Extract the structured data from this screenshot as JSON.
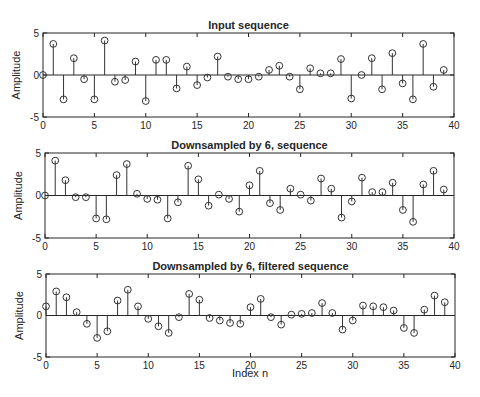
{
  "figure": {
    "width": 480,
    "height": 397,
    "xlabel_bottom": "Index n"
  },
  "chart_data": [
    {
      "type": "stem",
      "title": "Input sequence",
      "xlabel": "",
      "ylabel": "Amplitude",
      "xlim": [
        0,
        40
      ],
      "ylim": [
        -5,
        5
      ],
      "xticks": [
        0,
        5,
        10,
        15,
        20,
        25,
        30,
        35,
        40
      ],
      "yticks": [
        -5,
        0,
        5
      ],
      "grid": false,
      "x": [
        0,
        1,
        2,
        3,
        4,
        5,
        6,
        7,
        8,
        9,
        10,
        11,
        12,
        13,
        14,
        15,
        16,
        17,
        18,
        19,
        20,
        21,
        22,
        23,
        24,
        25,
        26,
        27,
        28,
        29,
        30,
        31,
        32,
        33,
        34,
        35,
        36,
        37,
        38,
        39
      ],
      "values": [
        0,
        3.7,
        -2.9,
        2.0,
        -0.5,
        -2.9,
        4.1,
        -0.8,
        -0.6,
        1.6,
        -3.1,
        1.8,
        1.8,
        -1.6,
        1.0,
        -1.2,
        -0.3,
        2.2,
        -0.2,
        -0.5,
        -0.5,
        -0.2,
        0.6,
        1.1,
        -0.2,
        -1.7,
        0.8,
        0.2,
        0.2,
        1.9,
        -2.8,
        0,
        2.0,
        -1.7,
        2.6,
        -1.0,
        -2.9,
        3.7,
        -1.4,
        0.6
      ]
    },
    {
      "type": "stem",
      "title": "Downsampled by 6,  sequence",
      "xlabel": "",
      "ylabel": "Amplitude",
      "xlim": [
        0,
        40
      ],
      "ylim": [
        -5,
        5
      ],
      "xticks": [
        0,
        5,
        10,
        15,
        20,
        25,
        30,
        35,
        40
      ],
      "yticks": [
        -5,
        0,
        5
      ],
      "grid": false,
      "x": [
        0,
        1,
        2,
        3,
        4,
        5,
        6,
        7,
        8,
        9,
        10,
        11,
        12,
        13,
        14,
        15,
        16,
        17,
        18,
        19,
        20,
        21,
        22,
        23,
        24,
        25,
        26,
        27,
        28,
        29,
        30,
        31,
        32,
        33,
        34,
        35,
        36,
        37,
        38,
        39
      ],
      "values": [
        0,
        4.1,
        1.8,
        -0.2,
        -0.2,
        -2.7,
        -2.8,
        2.4,
        3.7,
        0.2,
        -0.4,
        -0.5,
        -2.7,
        -0.8,
        3.5,
        1.9,
        -1.2,
        0.1,
        -0.4,
        -1.9,
        1.2,
        2.9,
        -0.9,
        -1.7,
        0.8,
        0.1,
        -0.6,
        2.0,
        0.8,
        -2.6,
        -0.7,
        2.1,
        0.4,
        0.4,
        1.5,
        -1.7,
        -3.1,
        1.3,
        2.9,
        0.7
      ]
    },
    {
      "type": "stem",
      "title": "Downsampled by 6, filtered sequence",
      "xlabel": "Index n",
      "ylabel": "Amplitude",
      "xlim": [
        0,
        40
      ],
      "ylim": [
        -5,
        5
      ],
      "xticks": [
        0,
        5,
        10,
        15,
        20,
        25,
        30,
        35,
        40
      ],
      "yticks": [
        -5,
        0,
        5
      ],
      "grid": false,
      "x": [
        0,
        1,
        2,
        3,
        4,
        5,
        6,
        7,
        8,
        9,
        10,
        11,
        12,
        13,
        14,
        15,
        16,
        17,
        18,
        19,
        20,
        21,
        22,
        23,
        24,
        25,
        26,
        27,
        28,
        29,
        30,
        31,
        32,
        33,
        34,
        35,
        36,
        37,
        38,
        39
      ],
      "values": [
        1.1,
        2.9,
        2.2,
        0.4,
        -1.0,
        -2.7,
        -1.9,
        1.8,
        3.1,
        1.1,
        -0.4,
        -1.3,
        -2.1,
        -0.2,
        2.6,
        1.9,
        -0.3,
        -0.6,
        -0.9,
        -1.0,
        1.0,
        2.0,
        -0.2,
        -1.1,
        0.1,
        0.2,
        0.3,
        1.5,
        0.3,
        -1.7,
        -0.6,
        1.2,
        1.1,
        1.0,
        0.6,
        -1.5,
        -2.1,
        0.7,
        2.4,
        1.6
      ]
    }
  ]
}
